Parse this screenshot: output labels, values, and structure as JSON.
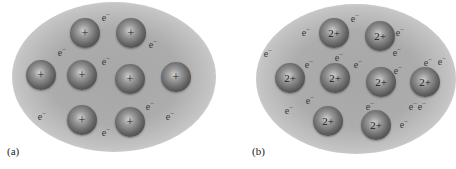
{
  "figure": {
    "panels": [
      {
        "label": "(a)",
        "ion_charge": "+",
        "electron_symbol": "e",
        "electron_charge": "−",
        "ions": [
          {
            "x": 85,
            "y": 33
          },
          {
            "x": 131,
            "y": 33
          },
          {
            "x": 41,
            "y": 75
          },
          {
            "x": 82,
            "y": 75
          },
          {
            "x": 130,
            "y": 79
          },
          {
            "x": 176,
            "y": 77
          },
          {
            "x": 82,
            "y": 120
          },
          {
            "x": 130,
            "y": 122
          }
        ],
        "electrons": [
          {
            "x": 106,
            "y": 17
          },
          {
            "x": 62,
            "y": 52
          },
          {
            "x": 106,
            "y": 61
          },
          {
            "x": 153,
            "y": 44
          },
          {
            "x": 42,
            "y": 116
          },
          {
            "x": 150,
            "y": 106
          },
          {
            "x": 170,
            "y": 116
          },
          {
            "x": 106,
            "y": 132
          }
        ]
      },
      {
        "label": "(b)",
        "ion_charge": "2+",
        "electron_symbol": "e",
        "electron_charge": "−",
        "ions": [
          {
            "x": 334,
            "y": 33
          },
          {
            "x": 380,
            "y": 36
          },
          {
            "x": 290,
            "y": 78
          },
          {
            "x": 335,
            "y": 78
          },
          {
            "x": 381,
            "y": 82
          },
          {
            "x": 425,
            "y": 82
          },
          {
            "x": 328,
            "y": 121
          },
          {
            "x": 376,
            "y": 125
          }
        ],
        "electrons": [
          {
            "x": 355,
            "y": 18
          },
          {
            "x": 306,
            "y": 32
          },
          {
            "x": 400,
            "y": 32
          },
          {
            "x": 268,
            "y": 53
          },
          {
            "x": 339,
            "y": 57
          },
          {
            "x": 397,
            "y": 52
          },
          {
            "x": 309,
            "y": 64
          },
          {
            "x": 358,
            "y": 64
          },
          {
            "x": 428,
            "y": 62
          },
          {
            "x": 398,
            "y": 70
          },
          {
            "x": 442,
            "y": 61
          },
          {
            "x": 310,
            "y": 100
          },
          {
            "x": 289,
            "y": 110
          },
          {
            "x": 370,
            "y": 106
          },
          {
            "x": 413,
            "y": 106
          },
          {
            "x": 422,
            "y": 106
          },
          {
            "x": 404,
            "y": 124
          }
        ]
      }
    ]
  }
}
